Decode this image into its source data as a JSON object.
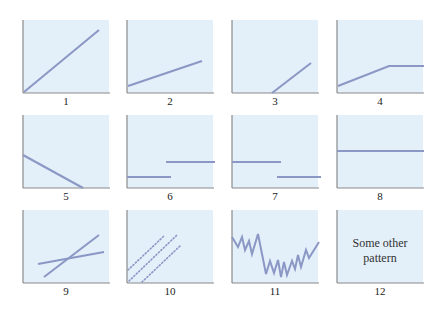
{
  "colors": {
    "panel_bg": "#e3eff9",
    "line": "#8b97c4",
    "axis": "#8a8a8a",
    "label": "#222222"
  },
  "layout": {
    "panel_width": 86,
    "panel_height": 73,
    "col_lefts": [
      23,
      127,
      232,
      337
    ],
    "row_tops": [
      20,
      115,
      210
    ]
  },
  "panels": [
    {
      "label": "1",
      "pattern": "steep-rising-line"
    },
    {
      "label": "2",
      "pattern": "gentle-rising-line"
    },
    {
      "label": "3",
      "pattern": "delayed-rising-line"
    },
    {
      "label": "4",
      "pattern": "rise-then-plateau"
    },
    {
      "label": "5",
      "pattern": "falling-line"
    },
    {
      "label": "6",
      "pattern": "step-up"
    },
    {
      "label": "7",
      "pattern": "step-down"
    },
    {
      "label": "8",
      "pattern": "flat-line"
    },
    {
      "label": "9",
      "pattern": "crossing-lines"
    },
    {
      "label": "10",
      "pattern": "parallel-dotted-lines"
    },
    {
      "label": "11",
      "pattern": "zigzag"
    },
    {
      "label": "12",
      "pattern": "other",
      "note_line1": "Some other",
      "note_line2": "pattern"
    }
  ]
}
